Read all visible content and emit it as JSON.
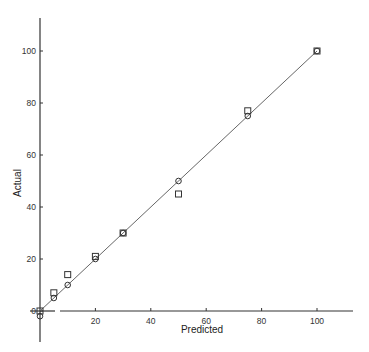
{
  "chart_data": {
    "type": "scatter",
    "title": "",
    "xlabel": "Predicted",
    "ylabel": "Actual",
    "xlim": [
      0,
      113
    ],
    "ylim": [
      -11,
      113
    ],
    "xticks": [
      0,
      20,
      40,
      60,
      80,
      100
    ],
    "yticks": [
      0,
      20,
      40,
      60,
      80,
      100
    ],
    "grid": false,
    "legend": null,
    "reference_line": {
      "name": "y = x",
      "x": [
        0,
        100
      ],
      "y": [
        0,
        100
      ]
    },
    "series": [
      {
        "name": "squares",
        "marker": "square",
        "points": [
          {
            "x": 0,
            "y": 0
          },
          {
            "x": 5,
            "y": 7
          },
          {
            "x": 10,
            "y": 14
          },
          {
            "x": 20,
            "y": 21
          },
          {
            "x": 30,
            "y": 30
          },
          {
            "x": 50,
            "y": 45
          },
          {
            "x": 75,
            "y": 77
          },
          {
            "x": 100,
            "y": 100
          }
        ]
      },
      {
        "name": "circles",
        "marker": "circle",
        "points": [
          {
            "x": 0,
            "y": -2
          },
          {
            "x": 5,
            "y": 5
          },
          {
            "x": 10,
            "y": 10
          },
          {
            "x": 20,
            "y": 20
          },
          {
            "x": 30,
            "y": 30
          },
          {
            "x": 50,
            "y": 50
          },
          {
            "x": 75,
            "y": 75
          },
          {
            "x": 100,
            "y": 100
          }
        ]
      }
    ]
  },
  "colors": {
    "axis": "#333333",
    "line": "#555555",
    "marker": "#333333"
  }
}
